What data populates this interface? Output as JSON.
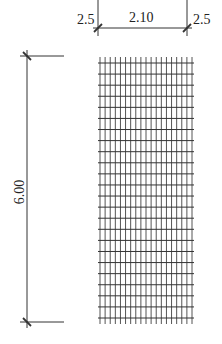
{
  "drawing": {
    "type": "reinforcement-mesh-elevation",
    "colors": {
      "line": "#333333",
      "mesh_line": "#555555",
      "background": "#ffffff"
    }
  },
  "dimensions": {
    "top": {
      "left_offset": "2.5",
      "width": "2.10",
      "right_offset": "2.5"
    },
    "left": {
      "height": "6.00"
    }
  },
  "mesh": {
    "x_start": 100,
    "x_end": 192,
    "y_start": 57,
    "y_end": 324,
    "vertical_bar_count": 19,
    "horizontal_bar_count": 24
  }
}
